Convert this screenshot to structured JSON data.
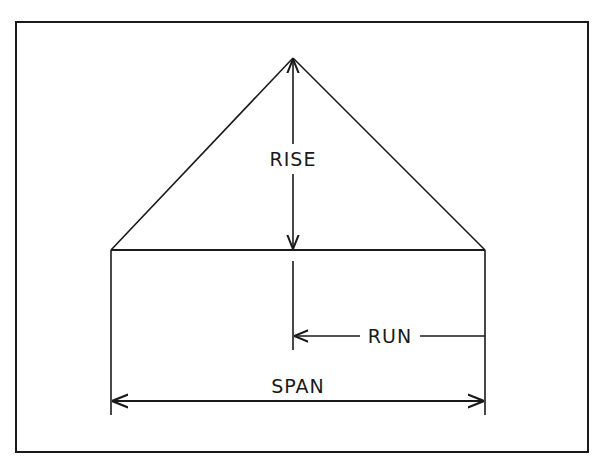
{
  "diagram": {
    "type": "roof-pitch-diagram",
    "labels": {
      "rise": "RISE",
      "run": "RUN",
      "span": "SPAN"
    },
    "colors": {
      "line": "#1a1a1a",
      "background": "#ffffff"
    }
  }
}
